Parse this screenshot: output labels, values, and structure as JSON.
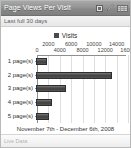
{
  "widget": {
    "title": "Page Views Per Visit",
    "subtitle": "Last full 30 days",
    "icons": [
      {
        "name": "window-icon",
        "glyph": "▣"
      },
      {
        "name": "pencil-edit-icon",
        "glyph": "✎"
      },
      {
        "name": "grid-view-icon",
        "glyph": "▒"
      }
    ]
  },
  "footer": {
    "link_label": "Live Data"
  },
  "chart_data": {
    "type": "bar",
    "orientation": "horizontal",
    "title": "Page Views Per Visit",
    "subtitle": "Last full 30 days",
    "caption": "November 7th - December 6th, 2008",
    "xlabel": "",
    "ylabel": "",
    "xlim": [
      0,
      16000
    ],
    "grid": true,
    "legend_position": "top-center",
    "legend": [
      "Visits"
    ],
    "series_color": "#3f3f3f",
    "categories": [
      "1 page(s)",
      "2 page(s)",
      "3 page(s)",
      "4 page(s)",
      "5 page(s)"
    ],
    "series": [
      {
        "name": "Visits",
        "values": [
          2000,
          13400,
          5300,
          2900,
          2300
        ]
      }
    ],
    "tick_rows": {
      "top": [
        {
          "value": 2000,
          "label": "2000"
        },
        {
          "value": 6000,
          "label": "6000"
        },
        {
          "value": 10000,
          "label": "10000"
        },
        {
          "value": 14000,
          "label": "14000"
        }
      ],
      "bottom": [
        {
          "value": 0,
          "label": "0"
        },
        {
          "value": 4000,
          "label": "4000"
        },
        {
          "value": 8000,
          "label": "8000"
        },
        {
          "value": 12000,
          "label": "12000"
        },
        {
          "value": 16000,
          "label": "16000"
        }
      ]
    },
    "gridline_values": [
      2000,
      4000,
      6000,
      8000,
      10000,
      12000,
      14000,
      16000
    ]
  }
}
